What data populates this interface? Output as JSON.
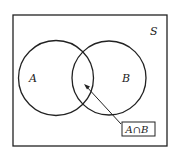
{
  "diagram": {
    "type": "venn",
    "universe_label": "S",
    "sets": [
      {
        "label": "A"
      },
      {
        "label": "B"
      }
    ],
    "intersection_label": "A∩B",
    "colors": {
      "stroke": "#222222",
      "background": "#ffffff"
    }
  }
}
